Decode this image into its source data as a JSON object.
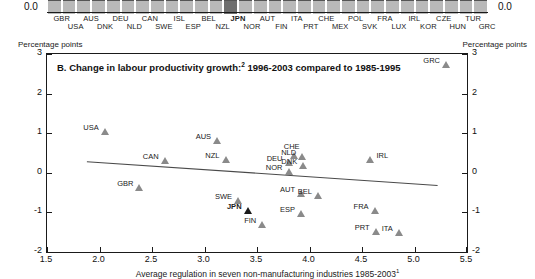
{
  "top_strip": {
    "zero_label_left": "0.0",
    "zero_label_right": "0.0",
    "highlight_country": "JPN",
    "labels_top": [
      "GBR",
      "AUS",
      "DEU",
      "CAN",
      "ISL",
      "BEL",
      "JPN",
      "AUT",
      "ITA",
      "CHE",
      "POL",
      "FRA",
      "IRL",
      "CZE",
      "TUR"
    ],
    "labels_bottom": [
      "USA",
      "DNK",
      "NLD",
      "SWE",
      "ESP",
      "NZL",
      "NOR",
      "FIN",
      "PRT",
      "MEX",
      "SVK",
      "LUX",
      "KOR",
      "HUN",
      "GRC"
    ]
  },
  "panel": {
    "unit_left": "Percentage points",
    "unit_right": "Percentage points",
    "title": "B. Change in labour productivity growth:",
    "title_sup": "2",
    "title_rest": " 1996-2003 compared to 1985-1995",
    "xaxis_title": "Average regulation in seven non-manufacturing industries 1985-2003",
    "xaxis_title_sup": "1"
  },
  "chart_data": {
    "type": "scatter",
    "title": "B. Change in labour productivity growth:2 1996-2003 compared to 1985-1995",
    "xlabel": "Average regulation in seven non-manufacturing industries 1985-20031",
    "ylabel": "Percentage points",
    "xlim": [
      1.5,
      5.5
    ],
    "ylim": [
      -2,
      3
    ],
    "xticks": [
      "1.5",
      "2.0",
      "2.5",
      "3.0",
      "3.5",
      "4.0",
      "4.5",
      "5.0",
      "5.5"
    ],
    "yticks": [
      "3",
      "2",
      "1",
      "0",
      "-1",
      "-2"
    ],
    "grid": false,
    "legend": "none",
    "highlight": "JPN",
    "points": [
      {
        "label": "USA",
        "x": 2.05,
        "y": 1.02,
        "lab": "left"
      },
      {
        "label": "GBR",
        "x": 2.38,
        "y": -0.38,
        "lab": "left"
      },
      {
        "label": "CAN",
        "x": 2.62,
        "y": 0.31,
        "lab": "left"
      },
      {
        "label": "AUS",
        "x": 3.12,
        "y": 0.8,
        "lab": "left"
      },
      {
        "label": "NZL",
        "x": 3.2,
        "y": 0.33,
        "lab": "left"
      },
      {
        "label": "SWE",
        "x": 3.32,
        "y": -0.72,
        "lab": "left"
      },
      {
        "label": "JPN",
        "x": 3.41,
        "y": -0.97,
        "lab": "left"
      },
      {
        "label": "FIN",
        "x": 3.55,
        "y": -1.33,
        "lab": "left"
      },
      {
        "label": "DEU",
        "x": 3.8,
        "y": 0.24,
        "lab": "left"
      },
      {
        "label": "NOR",
        "x": 3.8,
        "y": 0.02,
        "lab": "left"
      },
      {
        "label": "CHE",
        "x": 3.85,
        "y": 0.42,
        "lab": "above"
      },
      {
        "label": "NLD",
        "x": 3.93,
        "y": 0.4,
        "lab": "left"
      },
      {
        "label": "DNK",
        "x": 3.94,
        "y": 0.17,
        "lab": "left"
      },
      {
        "label": "AUT",
        "x": 3.92,
        "y": -0.53,
        "lab": "left"
      },
      {
        "label": "ESP",
        "x": 3.92,
        "y": -1.03,
        "lab": "left"
      },
      {
        "label": "BEL",
        "x": 4.08,
        "y": -0.58,
        "lab": "left"
      },
      {
        "label": "IRL",
        "x": 4.58,
        "y": 0.33,
        "lab": "right"
      },
      {
        "label": "FRA",
        "x": 4.62,
        "y": -0.97,
        "lab": "left"
      },
      {
        "label": "PRT",
        "x": 4.63,
        "y": -1.5,
        "lab": "left"
      },
      {
        "label": "ITA",
        "x": 4.85,
        "y": -1.52,
        "lab": "left"
      },
      {
        "label": "GRC",
        "x": 5.3,
        "y": 2.73,
        "lab": "left"
      }
    ],
    "trendline": {
      "x0": 1.88,
      "y0": 0.28,
      "x1": 5.22,
      "y1": -0.32
    }
  }
}
